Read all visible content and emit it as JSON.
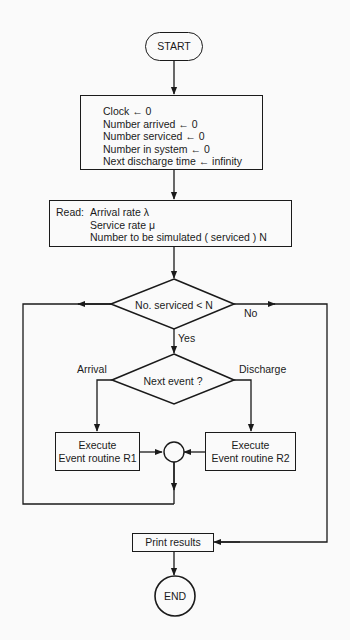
{
  "diagram": {
    "type": "flowchart",
    "start": {
      "label": "START"
    },
    "init_box": {
      "lines": [
        "Clock ← 0",
        "Number arrived ← 0",
        "Number serviced ← 0",
        "Number in system ← 0",
        "Next discharge time ← infinity"
      ]
    },
    "read_box": {
      "prefix": "Read:",
      "lines": [
        "Arrival rate λ",
        "Service rate μ",
        "Number to be simulated ( serviced ) N"
      ]
    },
    "decision_serviced": {
      "text": "No. serviced < N",
      "yes_label": "Yes",
      "no_label": "No"
    },
    "decision_event": {
      "text": "Next event ?",
      "left_label": "Arrival",
      "right_label": "Discharge"
    },
    "routine_r1": {
      "line1": "Execute",
      "line2": "Event routine R1"
    },
    "routine_r2": {
      "line1": "Execute",
      "line2": "Event routine R2"
    },
    "print_box": {
      "label": "Print results"
    },
    "end": {
      "label": "END"
    },
    "colors": {
      "stroke": "#1a1a1a",
      "background": "#fafafa"
    }
  }
}
